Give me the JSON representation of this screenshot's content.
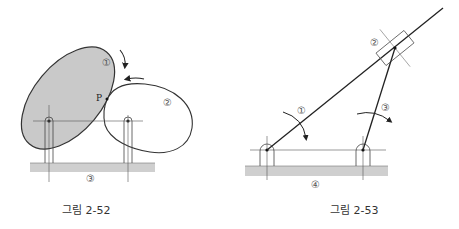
{
  "figures": [
    {
      "id": "fig-2-52",
      "caption": "그림 2-52",
      "labels": {
        "cam1": "①",
        "cam2": "②",
        "ground": "③",
        "contact_point": "P"
      },
      "colors": {
        "shaded_body": "#c9c9c9",
        "ground": "#cfcfcf",
        "line": "#333333"
      }
    },
    {
      "id": "fig-2-53",
      "caption": "그림 2-53",
      "labels": {
        "link1": "①",
        "slider": "②",
        "link3": "③",
        "ground": "④"
      },
      "colors": {
        "ground": "#cfcfcf",
        "line": "#222222"
      }
    }
  ]
}
